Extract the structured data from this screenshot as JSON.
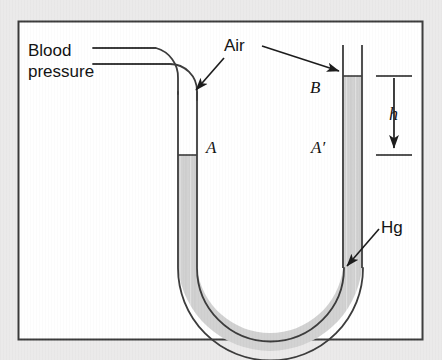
{
  "figure": {
    "frame": {
      "x": 18,
      "y": 21,
      "width": 405,
      "height": 319,
      "border_color": "#3a3a3a",
      "fill_color": "#ffffff"
    },
    "canvas": {
      "width": 442,
      "height": 360,
      "background_color": "#ebeaea"
    }
  },
  "labels": {
    "blood_pressure_line1": "Blood",
    "blood_pressure_line2": "pressure",
    "air": "Air",
    "mercury": "Hg",
    "point_a": "A",
    "point_a_prime": "A′",
    "point_b": "B",
    "height": "h"
  },
  "colors": {
    "mercury_fill": "#d2d2d2",
    "tube_outline": "#3a3a3a",
    "annotation": "#1a1a1a",
    "tube_interior": "#ffffff"
  },
  "geometry": {
    "left_tube": {
      "outer_x": 178,
      "inner_x": 197,
      "mercury_top_y": 155
    },
    "right_tube": {
      "outer_x": 343,
      "inner_x": 362,
      "mercury_top_y": 76
    },
    "bend": {
      "center_y": 268,
      "bottom_y": 331
    },
    "height_marker": {
      "x": 398,
      "top_y": 76,
      "bottom_y": 155,
      "value_label": "h"
    },
    "inlet_tube": {
      "top_line_y": 48,
      "bottom_line_y": 64,
      "start_x": 93,
      "bend_x": 185
    }
  },
  "annotations": {
    "air_arrow_left": {
      "from": [
        222,
        58
      ],
      "to": [
        194,
        92
      ],
      "target": "left-tube-air-column"
    },
    "air_arrow_right": {
      "from": [
        262,
        47
      ],
      "to": [
        341,
        72
      ],
      "target": "right-tube-air-column"
    },
    "hg_arrow": {
      "from": [
        379,
        228
      ],
      "to": [
        345,
        268
      ],
      "target": "mercury-in-bend"
    }
  }
}
